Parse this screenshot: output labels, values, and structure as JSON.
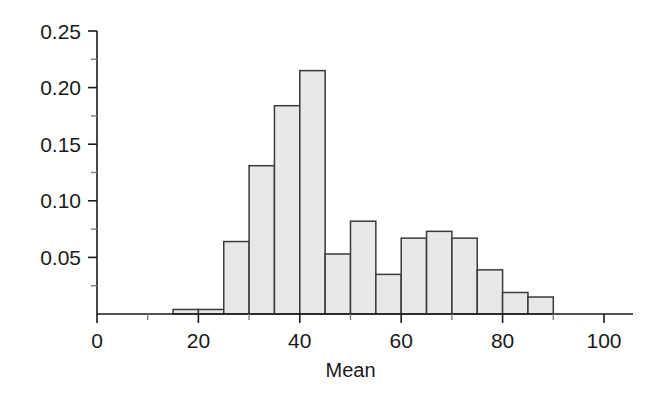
{
  "chart_data": {
    "type": "bar",
    "title": "",
    "subtitle": "",
    "xlabel": "Mean",
    "ylabel": "",
    "xlim": [
      0,
      104
    ],
    "ylim": [
      0,
      0.25
    ],
    "grid": false,
    "legend": false,
    "bin_width": 5,
    "bin_edges": [
      15,
      20,
      25,
      30,
      35,
      40,
      45,
      50,
      55,
      60,
      65,
      70,
      75,
      80,
      85,
      90
    ],
    "categories": [
      "15-20",
      "20-25",
      "25-30",
      "30-35",
      "35-40",
      "40-45",
      "45-50",
      "50-55",
      "55-60",
      "60-65",
      "65-70",
      "70-75",
      "75-80",
      "80-85",
      "85-90"
    ],
    "values": [
      0.004,
      0.004,
      0.064,
      0.131,
      0.184,
      0.215,
      0.053,
      0.082,
      0.035,
      0.067,
      0.073,
      0.067,
      0.039,
      0.019,
      0.015
    ],
    "xticks": [
      0,
      20,
      40,
      60,
      80,
      100
    ],
    "xtick_labels": [
      "0",
      "20",
      "40",
      "60",
      "80",
      "100"
    ],
    "xminor_ticks": [
      10,
      30,
      50,
      70,
      90
    ],
    "yticks": [
      0.05,
      0.1,
      0.15,
      0.2,
      0.25
    ],
    "ytick_labels": [
      "0.05",
      "0.10",
      "0.15",
      "0.20",
      "0.25"
    ],
    "yminor_ticks": [
      0.025,
      0.075,
      0.125,
      0.175,
      0.225
    ],
    "bar_fill_color": "#e8e8e8",
    "bar_edge_color": "#3a3a3a",
    "axis_color": "#1a1a1a"
  }
}
